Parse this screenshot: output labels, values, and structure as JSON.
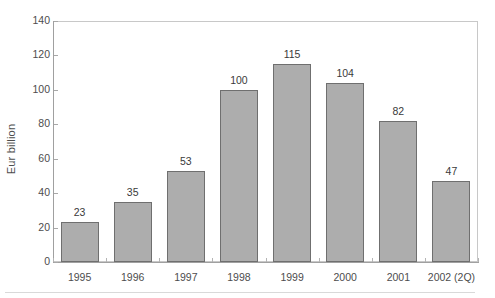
{
  "chart_data": {
    "type": "bar",
    "title": "",
    "subtitle": "",
    "xlabel": "",
    "ylabel": "Eur billion",
    "categories": [
      "1995",
      "1996",
      "1997",
      "1998",
      "1999",
      "2000",
      "2001",
      "2002 (2Q)"
    ],
    "values": [
      23,
      35,
      53,
      100,
      115,
      104,
      82,
      47
    ],
    "data_labels": [
      "23",
      "35",
      "53",
      "100",
      "115",
      "104",
      "82",
      "47"
    ],
    "ylim": [
      0,
      140
    ],
    "yticks": [
      0,
      20,
      40,
      60,
      80,
      100,
      120,
      140
    ],
    "ytick_labels": [
      "0",
      "20",
      "40",
      "60",
      "80",
      "100",
      "120",
      "140"
    ],
    "grid": false,
    "legend": null,
    "legend_position": "none",
    "bar_fill_color": "#adadad",
    "bar_border_color": "#6f6f6f",
    "axis_color": "#a0a0a0",
    "frame_color": "#c8c8c8",
    "text_color": "#4d4d4d",
    "background_color": "#ffffff"
  }
}
